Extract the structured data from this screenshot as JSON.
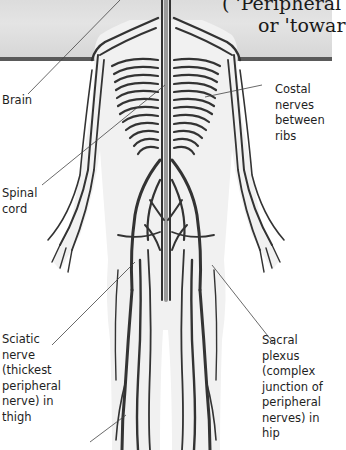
{
  "header": {
    "line1": "( 'Peripheral",
    "line2": "or 'towar",
    "band_color": "#dedede",
    "rule_color": "#5a5a5a"
  },
  "labels": {
    "brain": "Brain",
    "costal": "Costal\nnerves\nbetween\nribs",
    "spinal": "Spinal\ncord",
    "sciatic": "Sciatic\nnerve\n(thickest\nperipheral\nnerve) in\nthigh",
    "sacral": "Sacral plexus\n(complex\njunction of\nperipheral\nnerves) in hip"
  },
  "colors": {
    "nerve": "#333333",
    "body_halo": "#ececec"
  }
}
